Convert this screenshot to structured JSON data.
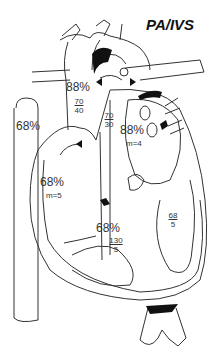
{
  "title": "PA/IVS",
  "labels": {
    "svc_sat": "68%",
    "ao_sat": "88%",
    "ao_pressure_sys": "70",
    "ao_pressure_dia": "40",
    "pda_pressure_sys": "70",
    "pda_pressure_dia": "30",
    "la_sat": "88%",
    "la_mean": "m=4",
    "ra_sat": "68%",
    "ra_mean": "m=5",
    "rv_sat": "68%",
    "rv_pressure_sys": "130",
    "rv_pressure_dia": "5",
    "lv_pressure_sys": "68",
    "lv_pressure_dia": "5"
  },
  "colors": {
    "stroke": "#333333",
    "fill": "#111111"
  }
}
